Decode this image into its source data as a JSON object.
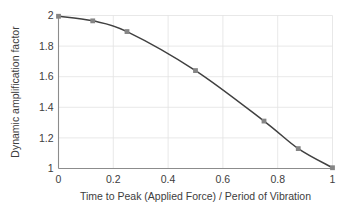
{
  "chart_data": {
    "type": "line",
    "title": "",
    "xlabel": "Time to Peak (Applied Force) / Period of Vibration",
    "ylabel": "Dynamic amplification factor",
    "xlim": [
      0,
      1
    ],
    "ylim": [
      1,
      2
    ],
    "grid": true,
    "legend": "none",
    "xticks": [
      0,
      0.2,
      0.4,
      0.6,
      0.8,
      1
    ],
    "xtick_labels": [
      "0",
      "0.2",
      "0.4",
      "0.6",
      "0.8",
      "1"
    ],
    "yticks": [
      1,
      1.2,
      1.4,
      1.6,
      1.8,
      2
    ],
    "ytick_labels": [
      "1",
      "1.2",
      "1.4",
      "1.6",
      "1.8",
      "2"
    ],
    "series": [
      {
        "name": "Dynamic amplification factor",
        "line_color": "#404040",
        "marker_color": "#858585",
        "marker": "square",
        "x": [
          0,
          0.125,
          0.25,
          0.5,
          0.75,
          0.875,
          1
        ],
        "values": [
          1.995,
          1.965,
          1.895,
          1.64,
          1.31,
          1.13,
          1.005
        ]
      }
    ]
  },
  "colors": {
    "line": "#404040",
    "marker": "#858585",
    "grid": "#e2e2e2",
    "axis": "#8c8c8c",
    "text": "#3d3d3d",
    "background": "#ffffff"
  }
}
